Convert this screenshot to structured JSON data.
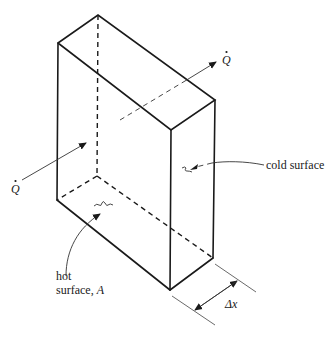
{
  "diagram": {
    "type": "isometric slab heat conduction",
    "labels": {
      "q_in": "Q",
      "q_out": "Q",
      "cold_surface": "cold surface",
      "hot_surface_line1": "hot",
      "hot_surface_line2": "surface, ",
      "hot_surface_area": "A",
      "thickness": "Δx"
    },
    "colors": {
      "line": "#1a1a1a",
      "background": "#ffffff"
    }
  }
}
